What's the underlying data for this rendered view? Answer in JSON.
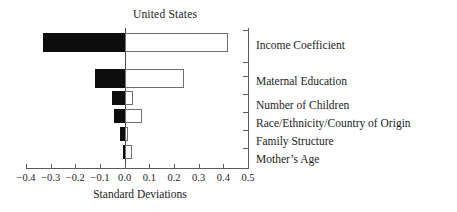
{
  "chart_data": {
    "type": "bar",
    "orientation": "horizontal",
    "title": "United States",
    "xlabel": "Standard Deviations",
    "ylabel": "",
    "xlim": [
      -0.4,
      0.5
    ],
    "grid": false,
    "legend": null,
    "xticks": [
      -0.4,
      -0.3,
      -0.2,
      -0.1,
      0.0,
      0.1,
      0.2,
      0.3,
      0.4,
      0.5
    ],
    "xtick_labels": [
      "−0.4",
      "−0.3",
      "−0.2",
      "−0.1",
      "0.0",
      "0.1",
      "0.2",
      "0.3",
      "0.4",
      "0.5"
    ],
    "categories": [
      "Income Coefficient",
      "Maternal Education",
      "Number of Children",
      "Race/Ethnicity/Country of Origin",
      "Family Structure",
      "Mother’s Age"
    ],
    "series": [
      {
        "name": "Negative (filled)",
        "color": "#0d0d0d",
        "values": [
          -0.33,
          -0.12,
          -0.05,
          -0.045,
          -0.02,
          -0.005
        ]
      },
      {
        "name": "Positive (open)",
        "color": "#ffffff",
        "values": [
          0.42,
          0.24,
          0.035,
          0.07,
          0.015,
          0.03
        ]
      }
    ],
    "bars": [
      {
        "category": "Income Coefficient",
        "negative": -0.33,
        "positive": 0.42,
        "top": 5,
        "height": 19
      },
      {
        "category": "Maternal Education",
        "negative": -0.12,
        "positive": 0.24,
        "top": 41,
        "height": 19
      },
      {
        "category": "Number of Children",
        "negative": -0.05,
        "positive": 0.035,
        "top": 63,
        "height": 14
      },
      {
        "category": "Race/Ethnicity/Country of Origin",
        "negative": -0.045,
        "positive": 0.07,
        "top": 81,
        "height": 14
      },
      {
        "category": "Family Structure",
        "negative": -0.02,
        "positive": 0.015,
        "top": 99,
        "height": 14
      },
      {
        "category": "Mother’s Age",
        "negative": -0.005,
        "positive": 0.03,
        "top": 117,
        "height": 14
      }
    ],
    "category_label_tops": [
      40,
      76,
      100,
      118,
      136,
      154
    ],
    "y_tick_tops": [
      30,
      62,
      76,
      94,
      112,
      130,
      148,
      168
    ]
  }
}
